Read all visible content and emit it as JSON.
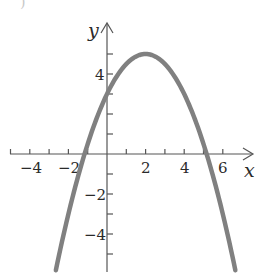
{
  "chart_data": {
    "type": "line",
    "title": "",
    "function": "f(x) = -0.5x^2 + 2x + 3",
    "xlabel": "x",
    "ylabel": "y",
    "xlim": [
      -5.5,
      7.5
    ],
    "ylim": [
      -6,
      6
    ],
    "x_ticks": [
      -5,
      -4,
      -3,
      -2,
      -1,
      1,
      2,
      3,
      4,
      5,
      6
    ],
    "x_tick_labels": [
      "-4",
      "-2",
      "2",
      "4",
      "6"
    ],
    "x_tick_label_values": [
      -4,
      -2,
      2,
      4,
      6
    ],
    "y_ticks": [
      -5,
      -4,
      -3,
      -2,
      -1,
      1,
      2,
      3,
      4,
      5
    ],
    "y_tick_labels": [
      "4",
      "-2",
      "-4"
    ],
    "y_tick_label_values": [
      4,
      -2,
      -4
    ],
    "grid": false,
    "legend": null,
    "series": [
      {
        "name": "parabola",
        "color": "#808080",
        "x": [
          -2.65,
          -2,
          -1.16,
          0,
          1,
          2,
          3,
          4,
          5.16,
          6,
          6.65
        ],
        "y": [
          -5.8,
          -3,
          0,
          3,
          4.5,
          5,
          4.5,
          3,
          0,
          -3,
          -5.8
        ]
      }
    ],
    "annotations": {
      "vertex": [
        2,
        5
      ],
      "y_intercept": 3,
      "x_intercepts": [
        -1.16,
        5.16
      ]
    }
  },
  "labels": {
    "x_axis": "x",
    "y_axis": "y",
    "xt_m4": "−4",
    "xt_m2": "−2",
    "xt_2": "2",
    "xt_4": "4",
    "xt_6": "6",
    "yt_4": "4",
    "yt_m2": "−2",
    "yt_m4": "−4",
    "crop_mark": ")"
  }
}
